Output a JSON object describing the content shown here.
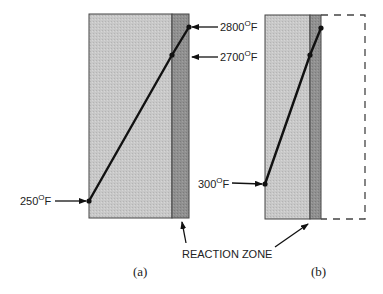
{
  "colors": {
    "wall_fill": "#c4c4c4",
    "reaction_zone_fill": "#8e8e8e",
    "stroke": "#333333",
    "line": "#111111"
  },
  "panels": [
    {
      "caption": "(a)",
      "points": [
        {
          "label": "250°F",
          "temperature": "250",
          "unit": "F"
        },
        {
          "label": "2700°F",
          "temperature": "2700",
          "unit": "F"
        },
        {
          "label": "2800°F",
          "temperature": "2800",
          "unit": "F"
        }
      ]
    },
    {
      "caption": "(b)",
      "points": [
        {
          "label": "300°F",
          "temperature": "300",
          "unit": "F"
        }
      ]
    }
  ],
  "labels": {
    "t250": {
      "num": "250",
      "deg": "O",
      "unit": "F"
    },
    "t2700": {
      "num": "2700",
      "deg": "O",
      "unit": "F"
    },
    "t2800": {
      "num": "2800",
      "deg": "O",
      "unit": "F"
    },
    "t300": {
      "num": "300",
      "deg": "O",
      "unit": "F"
    },
    "reaction_zone": "REACTION ZONE",
    "caption_a": "(a)",
    "caption_b": "(b)"
  }
}
